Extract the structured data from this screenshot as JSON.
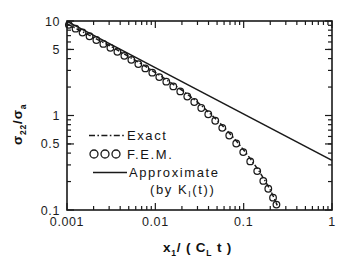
{
  "chart_data": {
    "type": "line",
    "title": "",
    "xlabel": "x_1/(C_L t)",
    "xlabel_parts": {
      "main1": "x",
      "sub1": "1",
      "mid": "/ ( C",
      "sub2": "L",
      "tail": " t )"
    },
    "ylabel": "sigma_22 / sigma_a",
    "ylabel_parts": {
      "sym1": "σ",
      "sub1": "22",
      "slash": "/",
      "sym2": "σ",
      "sub2": "a"
    },
    "xscale": "log",
    "yscale": "log",
    "xlim": [
      0.001,
      1
    ],
    "ylim": [
      0.1,
      10
    ],
    "grid": false,
    "xticks": [
      0.001,
      0.01,
      0.1,
      1
    ],
    "xtick_labels": [
      "0.001",
      "0.01",
      "0.1",
      "1"
    ],
    "yticks": [
      0.1,
      0.5,
      1,
      5,
      10
    ],
    "ytick_labels": [
      "0.1",
      "0.5",
      "1",
      "5",
      "10"
    ],
    "tick_direction": "in",
    "frame": "box",
    "legend_position": "center-left",
    "series": [
      {
        "name": "Exact",
        "style": "dash-dot",
        "marker": "none",
        "color": "#1a1a1a",
        "points": [
          [
            0.001,
            9.35
          ],
          [
            0.0012,
            8.55
          ],
          [
            0.0015,
            7.7
          ],
          [
            0.0018,
            7.05
          ],
          [
            0.0022,
            6.4
          ],
          [
            0.0027,
            5.8
          ],
          [
            0.0033,
            5.25
          ],
          [
            0.0039,
            4.8
          ],
          [
            0.0047,
            4.35
          ],
          [
            0.0056,
            3.95
          ],
          [
            0.0068,
            3.55
          ],
          [
            0.0082,
            3.2
          ],
          [
            0.0098,
            2.88
          ],
          [
            0.0118,
            2.58
          ],
          [
            0.0142,
            2.3
          ],
          [
            0.017,
            2.05
          ],
          [
            0.0205,
            1.82
          ],
          [
            0.0246,
            1.6
          ],
          [
            0.0295,
            1.4
          ],
          [
            0.0354,
            1.21
          ],
          [
            0.0425,
            1.03
          ],
          [
            0.051,
            0.875
          ],
          [
            0.0612,
            0.735
          ],
          [
            0.0734,
            0.61
          ],
          [
            0.088,
            0.5
          ],
          [
            0.1056,
            0.405
          ],
          [
            0.1267,
            0.322
          ],
          [
            0.152,
            0.252
          ],
          [
            0.178,
            0.198
          ],
          [
            0.2,
            0.163
          ],
          [
            0.22,
            0.135
          ],
          [
            0.24,
            0.112
          ]
        ]
      },
      {
        "name": "F.E.M.",
        "style": "markers",
        "marker": "open-circle",
        "color": "#1a1a1a",
        "points": [
          [
            0.00105,
            9.1
          ],
          [
            0.00125,
            8.3
          ],
          [
            0.0015,
            7.55
          ],
          [
            0.0018,
            6.9
          ],
          [
            0.00215,
            6.3
          ],
          [
            0.00258,
            5.72
          ],
          [
            0.0031,
            5.2
          ],
          [
            0.00372,
            4.72
          ],
          [
            0.00446,
            4.28
          ],
          [
            0.00535,
            3.88
          ],
          [
            0.00642,
            3.5
          ],
          [
            0.0077,
            3.15
          ],
          [
            0.00924,
            2.84
          ],
          [
            0.01109,
            2.55
          ],
          [
            0.01331,
            2.28
          ],
          [
            0.01597,
            2.03
          ],
          [
            0.01916,
            1.8
          ],
          [
            0.023,
            1.59
          ],
          [
            0.0276,
            1.39
          ],
          [
            0.03312,
            1.2
          ],
          [
            0.03974,
            1.03
          ],
          [
            0.04769,
            0.88
          ],
          [
            0.05723,
            0.74
          ],
          [
            0.06868,
            0.615
          ],
          [
            0.08241,
            0.505
          ],
          [
            0.09889,
            0.41
          ],
          [
            0.11867,
            0.327
          ],
          [
            0.1424,
            0.258
          ],
          [
            0.16688,
            0.203
          ],
          [
            0.19,
            0.168
          ],
          [
            0.215,
            0.135
          ],
          [
            0.235,
            0.114
          ]
        ]
      },
      {
        "name": "Approximate",
        "sub_label": "(by K_I(t))",
        "style": "solid",
        "marker": "none",
        "color": "#1a1a1a",
        "points": [
          [
            0.001,
            9.9
          ],
          [
            1.0,
            0.335
          ]
        ]
      }
    ]
  },
  "legend": {
    "items": [
      {
        "label": "Exact",
        "marker": "dash-dot-line"
      },
      {
        "label": "F.E.M.",
        "marker": "open-circles"
      },
      {
        "label": "Approximate",
        "marker": "solid-line"
      }
    ],
    "note_prefix": "(by K",
    "note_sub": "I",
    "note_suffix": "(t))"
  },
  "axes": {
    "x": {
      "labels": [
        "0.001",
        "0.01",
        "0.1",
        "1"
      ],
      "title_main": "x",
      "title_sub": "1",
      "title_mid": "/ ( C",
      "title_sub2": "L",
      "title_tail": " t )"
    },
    "y": {
      "labels": [
        "10",
        "5",
        "1",
        "0.5",
        "0.1"
      ],
      "title_sym": "σ",
      "title_sub": "22",
      "title_slash": "/",
      "title_sym2": "σ",
      "title_sub2": "a"
    }
  },
  "colors": {
    "background": "#ffffff",
    "ink": "#1a1a1a",
    "axis": "#1a1a1a"
  }
}
